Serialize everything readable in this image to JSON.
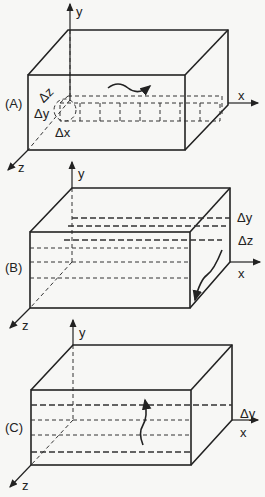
{
  "panels": [
    {
      "id": "A",
      "label": "(A)",
      "axes": {
        "x": "x",
        "y": "y",
        "z": "z"
      },
      "annotations": [
        "Δz",
        "Δy",
        "Δx"
      ]
    },
    {
      "id": "B",
      "label": "(B)",
      "axes": {
        "x": "x",
        "y": "y",
        "z": "z"
      },
      "annotations": [
        "Δy",
        "Δz"
      ]
    },
    {
      "id": "C",
      "label": "(C)",
      "axes": {
        "x": "x",
        "y": "y",
        "z": "z"
      },
      "annotations": [
        "Δy"
      ]
    }
  ]
}
